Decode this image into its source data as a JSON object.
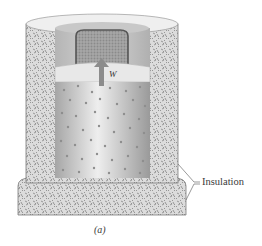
{
  "figure": {
    "caption": "(a)",
    "labels": {
      "insulation": "Insulation",
      "work": "W"
    },
    "components": [
      "insulated walls",
      "insulated base",
      "lead shot container",
      "piston",
      "gas cylinder",
      "work arrow"
    ],
    "colors": {
      "insulation": "#d9d9d9",
      "insulation_speckle": "#8a8a8a",
      "cavity_wall": "#bdbdbd",
      "lid_ring": "#eeeeee",
      "lead_shot": "#9a9a9a",
      "lead_border": "#555555",
      "piston": "#e6e6e6",
      "gas_light": "#e8e8e8",
      "gas_dark": "#9e9e9e",
      "gas_particle": "#888888",
      "arrow": "#8c8c8c"
    }
  }
}
